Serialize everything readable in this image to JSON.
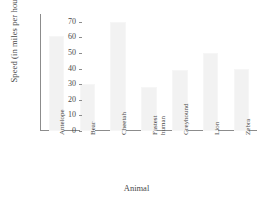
{
  "chart_data": {
    "type": "bar",
    "title": "",
    "xlabel": "Animal",
    "ylabel": "Speed (in miles per hour)",
    "categories": [
      "Antelope",
      "Bear",
      "Cheetah",
      "Fastest\nhuman",
      "Greyhound",
      "Lion",
      "Zebra"
    ],
    "values": [
      61,
      30,
      70,
      28,
      39,
      50,
      40
    ],
    "ylim": [
      0,
      75
    ],
    "yticks": [
      0,
      10,
      20,
      30,
      40,
      50,
      60,
      70
    ],
    "ytick_labels": [
      "0",
      "10",
      "20",
      "30",
      "40",
      "50",
      "60",
      "70"
    ],
    "grid": false,
    "legend": null,
    "bar_color": "#f2f2f2",
    "axis_color": "#8c8c8c",
    "text_color": "#4a4a4a"
  }
}
